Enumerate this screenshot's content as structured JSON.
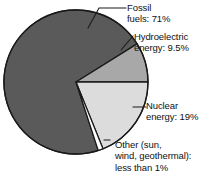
{
  "figure": {
    "title": "",
    "background_color": "#ffffff"
  },
  "chart_data": {
    "type": "pie",
    "title": "",
    "subtitle": "",
    "xlabel": "",
    "ylabel": "",
    "grid": false,
    "legend_position": "callout-labels",
    "total_label": "",
    "categories": [
      "Fossil fuels",
      "Hydroelectric energy",
      "Nuclear energy",
      "Other (sun, wind, geothermal)"
    ],
    "values": [
      71,
      9.5,
      19,
      0.5
    ],
    "value_display": [
      "71%",
      "9.5%",
      "19%",
      "less than 1%"
    ],
    "colors": [
      "#5a5a5a",
      "#a8a8a8",
      "#dcdcdc",
      "#ffffff"
    ],
    "slices": [
      {
        "name": "Fossil fuels",
        "value": 71,
        "value_text": "71%",
        "label_text": "Fossil\nfuels: 71%",
        "color": "#5a5a5a",
        "start_angle_deg": 72,
        "end_angle_deg": 328
      },
      {
        "name": "Hydroelectric energy",
        "value": 9.5,
        "value_text": "9.5%",
        "label_text": "Hydroelectric\nenergy: 9.5%",
        "color": "#a8a8a8",
        "start_angle_deg": 328,
        "end_angle_deg": 360
      },
      {
        "name": "Nuclear energy",
        "value": 19,
        "value_text": "19%",
        "label_text": "Nuclear\nenergy: 19%",
        "color": "#dcdcdc",
        "start_angle_deg": 0,
        "end_angle_deg": 68
      },
      {
        "name": "Other (sun, wind, geothermal)",
        "value": 0.5,
        "value_text": "less than 1%",
        "label_text": "Other (sun,\nwind, geothermal):\nless than 1%",
        "color": "#ffffff",
        "start_angle_deg": 68,
        "end_angle_deg": 72
      }
    ],
    "geometry": {
      "center_x": 76,
      "center_y": 82,
      "radius": 72,
      "outline_color": "#1a1a1a",
      "outline_width": 1.3
    }
  },
  "labels": {
    "fossil": "Fossil\nfuels: 71%",
    "hydro": "Hydroelectric\nenergy: 9.5%",
    "nuclear": "Nuclear\nenergy: 19%",
    "other": "Other (sun,\nwind, geothermal):\nless than 1%"
  }
}
